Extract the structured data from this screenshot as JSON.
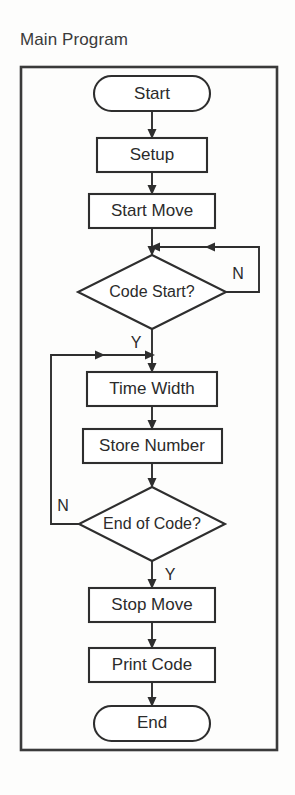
{
  "diagram": {
    "title": "Main Program",
    "type": "flowchart",
    "orientation": "top-to-bottom",
    "frame": {
      "x": 21,
      "y": 67,
      "width": 256,
      "height": 683
    },
    "colors": {
      "background": "#fdfdfc",
      "stroke": "#2e2e2e",
      "frame_stroke": "#3a3a3a",
      "node_fill": "#ffffff",
      "text": "#2b2b2b"
    },
    "nodes": [
      {
        "id": "start",
        "shape": "terminator",
        "label": "Start",
        "cx": 152,
        "cy": 94,
        "w": 116,
        "h": 35
      },
      {
        "id": "setup",
        "shape": "process",
        "label": "Setup",
        "cx": 152,
        "cy": 155,
        "w": 110,
        "h": 34
      },
      {
        "id": "start_move",
        "shape": "process",
        "label": "Start Move",
        "cx": 152,
        "cy": 211,
        "w": 126,
        "h": 34
      },
      {
        "id": "code_start",
        "shape": "decision",
        "label": "Code Start?",
        "cx": 152,
        "cy": 292,
        "w": 148,
        "h": 74
      },
      {
        "id": "time_width",
        "shape": "process",
        "label": "Time Width",
        "cx": 152,
        "cy": 389,
        "w": 130,
        "h": 34
      },
      {
        "id": "store_number",
        "shape": "process",
        "label": "Store Number",
        "cx": 152,
        "cy": 446,
        "w": 139,
        "h": 34
      },
      {
        "id": "end_of_code",
        "shape": "decision",
        "label": "End of Code?",
        "cx": 152,
        "cy": 524,
        "w": 146,
        "h": 74
      },
      {
        "id": "stop_move",
        "shape": "process",
        "label": "Stop Move",
        "cx": 152,
        "cy": 605,
        "w": 126,
        "h": 34
      },
      {
        "id": "print_code",
        "shape": "process",
        "label": "Print Code",
        "cx": 152,
        "cy": 665,
        "w": 126,
        "h": 34
      },
      {
        "id": "end",
        "shape": "terminator",
        "label": "End",
        "cx": 152,
        "cy": 723,
        "w": 116,
        "h": 35
      }
    ],
    "edges": [
      {
        "id": "e-start-setup",
        "from": "start",
        "to": "setup",
        "label": ""
      },
      {
        "id": "e-setup-startmove",
        "from": "setup",
        "to": "start_move",
        "label": ""
      },
      {
        "id": "e-startmove-codestart",
        "from": "start_move",
        "to": "code_start",
        "label": ""
      },
      {
        "id": "e-codestart-no",
        "from": "code_start",
        "to": "code_start",
        "label": "N"
      },
      {
        "id": "e-codestart-yes",
        "from": "code_start",
        "to": "time_width",
        "label": "Y"
      },
      {
        "id": "e-timewidth-store",
        "from": "time_width",
        "to": "store_number",
        "label": ""
      },
      {
        "id": "e-store-endofcode",
        "from": "store_number",
        "to": "end_of_code",
        "label": ""
      },
      {
        "id": "e-endofcode-no",
        "from": "end_of_code",
        "to": "time_width",
        "label": "N"
      },
      {
        "id": "e-endofcode-yes",
        "from": "end_of_code",
        "to": "stop_move",
        "label": "Y"
      },
      {
        "id": "e-stopmove-printcode",
        "from": "stop_move",
        "to": "print_code",
        "label": ""
      },
      {
        "id": "e-printcode-end",
        "from": "print_code",
        "to": "end",
        "label": ""
      }
    ],
    "branch_labels": {
      "code_start_no": "N",
      "code_start_yes": "Y",
      "end_of_code_no": "N",
      "end_of_code_yes": "Y"
    }
  }
}
